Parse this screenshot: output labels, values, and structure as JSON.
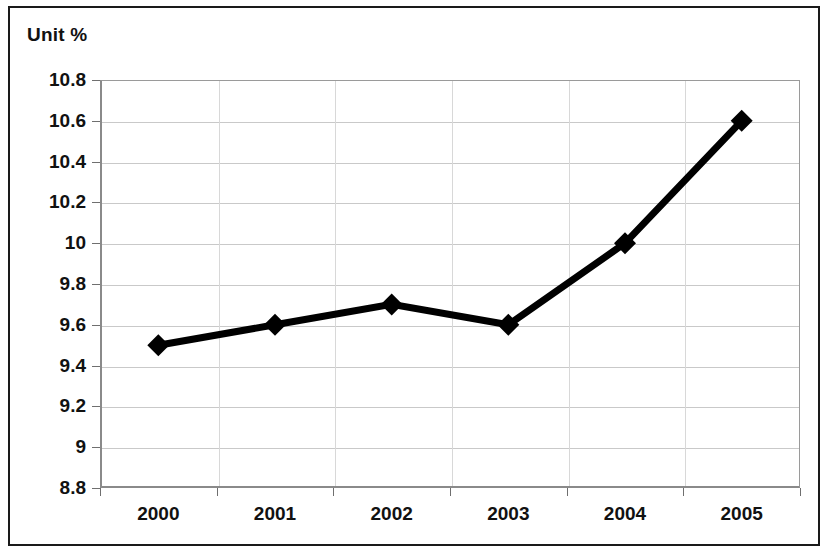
{
  "chart_data": {
    "type": "line",
    "title": "Unit %",
    "xlabel": "",
    "ylabel": "",
    "categories": [
      "2000",
      "2001",
      "2002",
      "2003",
      "2004",
      "2005"
    ],
    "values": [
      9.5,
      9.6,
      9.7,
      9.6,
      10,
      10.6
    ],
    "series": [
      {
        "name": "Unit %",
        "values": [
          9.5,
          9.6,
          9.7,
          9.6,
          10,
          10.6
        ]
      }
    ],
    "ylim": [
      8.8,
      10.8
    ],
    "ytick_labels": [
      "10.8",
      "10.6",
      "10.4",
      "10.2",
      "10",
      "9.8",
      "9.6",
      "9.4",
      "9.2",
      "9",
      "8.8"
    ],
    "ytick_values": [
      10.8,
      10.6,
      10.4,
      10.2,
      10,
      9.8,
      9.6,
      9.4,
      9.2,
      9,
      8.8
    ],
    "ystep": 0.2,
    "grid": true,
    "grid_axis": "y",
    "legend": false,
    "legend_position": "none",
    "marker": "diamond",
    "line_color": "#000000",
    "marker_color": "#000000",
    "grid_color": "#c9c9c9",
    "axis_color": "#8a8a8a",
    "background_color": "#ffffff",
    "border_color": "#1a1a1a"
  }
}
